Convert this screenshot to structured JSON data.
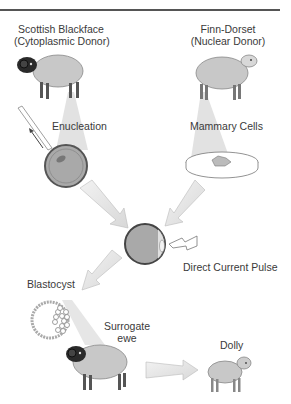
{
  "diagram": {
    "donors": {
      "cytoplasmic": {
        "name": "Scottish Blackface",
        "role": "(Cytoplasmic Donor)"
      },
      "nuclear": {
        "name": "Finn-Dorset",
        "role": "(Nuclear Donor)"
      }
    },
    "steps": {
      "enucleation": "Enucleation",
      "mammary_cells": "Mammary Cells",
      "pulse": "Direct Current Pulse",
      "blastocyst": "Blastocyst",
      "surrogate_line1": "Surrogate",
      "surrogate_line2": "ewe",
      "dolly": "Dolly"
    },
    "colors": {
      "sheep_body": "#c8c8c8",
      "black_face": "#2a2a2a",
      "egg_fill": "#a9a9a9",
      "egg_ring": "#555555",
      "arrow_fill": "#e8e8e8",
      "beam": "#dcdcdc"
    }
  }
}
